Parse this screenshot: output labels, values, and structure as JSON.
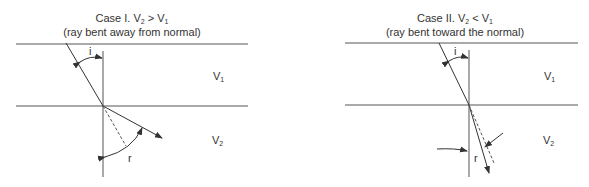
{
  "case1": {
    "title_prefix": "Case I. V",
    "title_sub1": "2",
    "title_op": " > V",
    "title_sub2": "1",
    "subtitle": "(ray bent away from normal)",
    "angle_incident": "i",
    "angle_refracted": "r",
    "layer1_label": "V",
    "layer1_sub": "1",
    "layer2_label": "V",
    "layer2_sub": "2"
  },
  "case2": {
    "title_prefix": "Case II. V",
    "title_sub1": "2",
    "title_op": " < V",
    "title_sub2": "1",
    "subtitle": "(ray bent toward the normal)",
    "angle_incident": "i",
    "angle_refracted": "r",
    "layer1_label": "V",
    "layer1_sub": "1",
    "layer2_label": "V",
    "layer2_sub": "2"
  },
  "colors": {
    "line": "#444444",
    "text": "#333333"
  }
}
